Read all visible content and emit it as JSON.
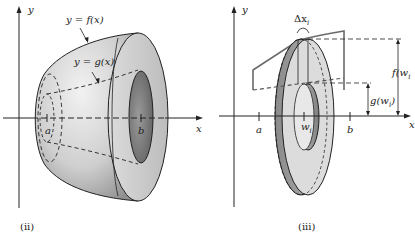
{
  "figures": [
    {
      "id": "ii",
      "caption": "(ii)",
      "labels": {
        "y_axis": "y",
        "x_axis": "x",
        "outer_curve": "y = f(x)",
        "inner_curve": "y = g(x)",
        "a": "a",
        "b": "b"
      }
    },
    {
      "id": "iii",
      "caption": "(iii)",
      "labels": {
        "y_axis": "y",
        "x_axis": "x",
        "delta": "Δx",
        "delta_sub": "i",
        "f_w": "f(w",
        "g_w": "g(w",
        "w_sub": "i",
        "close_paren": ")",
        "a": "a",
        "b": "b",
        "w": "w",
        "w_label_sub": "i"
      }
    }
  ],
  "colors": {
    "line": "#222222",
    "surface_light": "#e4e4e4",
    "surface_mid": "#bdbdbd",
    "surface_dark": "#8e8e8e"
  }
}
